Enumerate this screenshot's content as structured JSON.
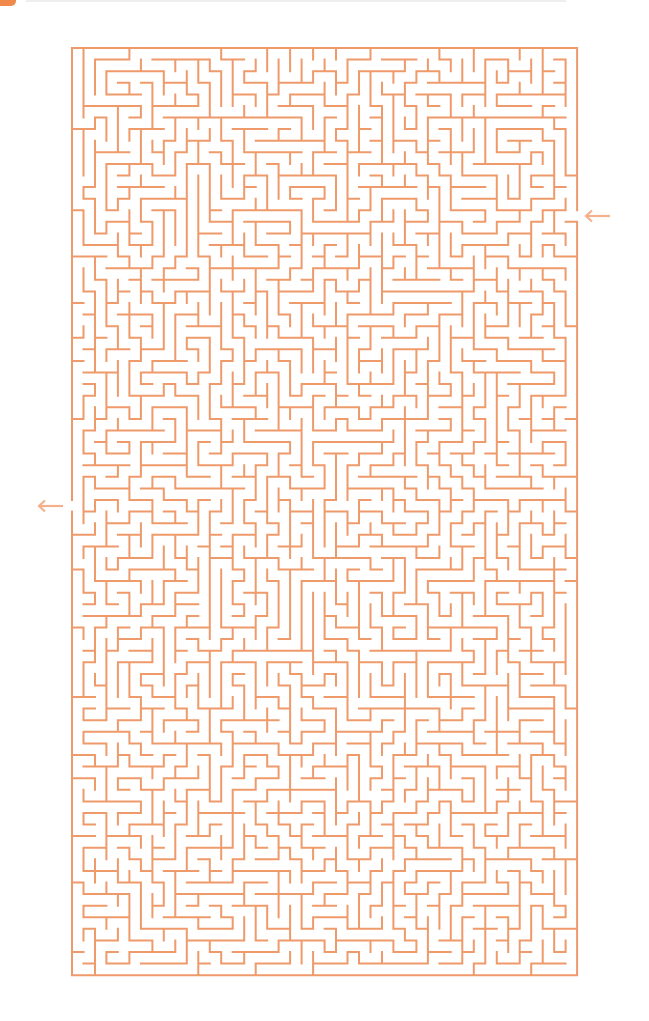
{
  "puzzle": {
    "type": "maze",
    "cols": 44,
    "rows": 80,
    "origin": {
      "x": 72,
      "y": 48
    },
    "cell_w": 11.48,
    "cell_h": 11.59,
    "line_color": "#ee9a6a",
    "line_width": 2,
    "seed": 20240517,
    "entrance": {
      "side": "right",
      "row": 14,
      "arrow_icon": "arrow-left-icon"
    },
    "exit": {
      "side": "left",
      "row": 39,
      "arrow_icon": "arrow-left-icon"
    }
  },
  "colors": {
    "background": "#ffffff",
    "accent_tab": "#f08a4b",
    "arrow": "#f4b08a"
  }
}
